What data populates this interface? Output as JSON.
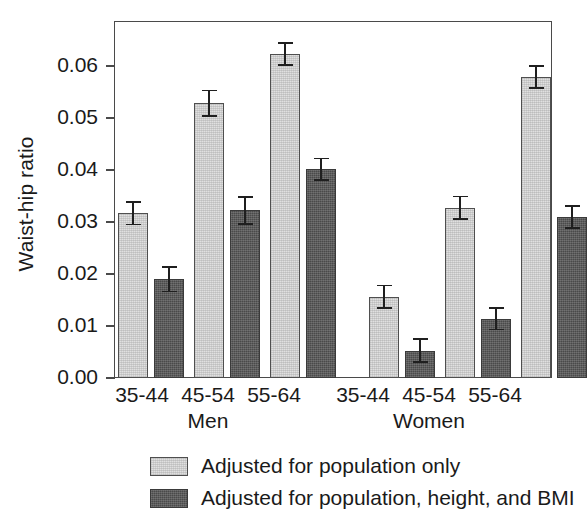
{
  "chart_data": {
    "type": "bar",
    "title": "",
    "xlabel": "",
    "ylabel": "Waist-hip ratio",
    "ylim": [
      0.0,
      0.065
    ],
    "yticks": [
      0.0,
      0.01,
      0.02,
      0.03,
      0.04,
      0.05,
      0.06
    ],
    "ytick_labels": [
      "0.00",
      "0.01",
      "0.02",
      "0.03",
      "0.04",
      "0.05",
      "0.06"
    ],
    "grid": false,
    "legend_position": "below-axes-left",
    "groups": [
      "Men",
      "Women"
    ],
    "categories": [
      "35-44",
      "45-54",
      "55-64",
      "35-44",
      "45-54",
      "55-64"
    ],
    "series": [
      {
        "name": "Adjusted for population only",
        "color": "#e0e0e0",
        "values": [
          0.03,
          0.05,
          0.059,
          0.0148,
          0.031,
          0.0548
        ],
        "err_low": [
          0.0022,
          0.0025,
          0.0022,
          0.0022,
          0.0022,
          0.0022
        ],
        "err_high": [
          0.0022,
          0.0025,
          0.0022,
          0.0022,
          0.0022,
          0.0022
        ]
      },
      {
        "name": "Adjusted for population, height, and BMI",
        "color": "#4a4a4a",
        "values": [
          0.018,
          0.0305,
          0.038,
          0.005,
          0.0108,
          0.0293
        ],
        "err_low": [
          0.0024,
          0.0026,
          0.0021,
          0.0022,
          0.0021,
          0.0022
        ],
        "err_high": [
          0.0024,
          0.0026,
          0.0021,
          0.0022,
          0.0021,
          0.0022
        ]
      }
    ],
    "legend": [
      "Adjusted for population only",
      "Adjusted for population, height, and BMI"
    ]
  },
  "axis": {
    "ylabel": "Waist-hip ratio",
    "ytick_labels": [
      "0.06",
      "0.05",
      "0.04",
      "0.03",
      "0.02",
      "0.01",
      "0.00"
    ],
    "xtick_labels": [
      "35-44",
      "45-54",
      "55-64",
      "35-44",
      "45-54",
      "55-64"
    ],
    "group_labels": [
      "Men",
      "Women"
    ]
  },
  "legend": {
    "items": [
      {
        "label": "Adjusted for population only",
        "swatch": "light-gray-swatch"
      },
      {
        "label": "Adjusted for population, height, and BMI",
        "swatch": "dark-gray-swatch"
      }
    ]
  }
}
